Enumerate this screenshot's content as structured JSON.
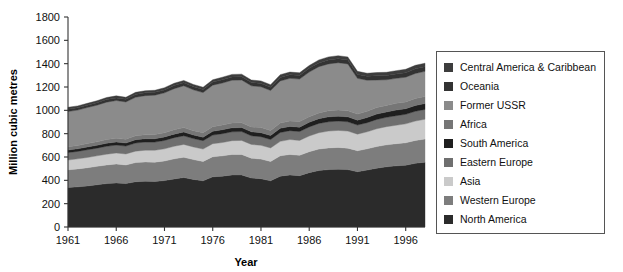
{
  "chart_data": {
    "type": "area",
    "title": "",
    "xlabel": "Year",
    "ylabel": "Million cubic metres",
    "xlim": [
      1961,
      1998
    ],
    "ylim": [
      0,
      1800
    ],
    "ytick_step": 200,
    "xtick_step": 5,
    "grid": false,
    "stacked": true,
    "legend_position": "right",
    "xticks": [
      1961,
      1966,
      1971,
      1976,
      1981,
      1986,
      1991,
      1996
    ],
    "yticks": [
      0,
      200,
      400,
      600,
      800,
      1000,
      1200,
      1400,
      1600,
      1800
    ],
    "x": [
      1961,
      1962,
      1963,
      1964,
      1965,
      1966,
      1967,
      1968,
      1969,
      1970,
      1971,
      1972,
      1973,
      1974,
      1975,
      1976,
      1977,
      1978,
      1979,
      1980,
      1981,
      1982,
      1983,
      1984,
      1985,
      1986,
      1987,
      1988,
      1989,
      1990,
      1991,
      1992,
      1993,
      1994,
      1995,
      1996,
      1997,
      1998
    ],
    "series": [
      {
        "name": "North America",
        "color": "#2b2b2b",
        "values": [
          338,
          344,
          352,
          362,
          372,
          378,
          372,
          388,
          392,
          390,
          398,
          412,
          424,
          408,
          396,
          430,
          436,
          446,
          446,
          420,
          414,
          396,
          436,
          446,
          440,
          466,
          484,
          492,
          496,
          492,
          474,
          488,
          504,
          516,
          524,
          530,
          546,
          556
        ]
      },
      {
        "name": "Western Europe",
        "color": "#7d7d7d",
        "values": [
          152,
          154,
          156,
          158,
          160,
          162,
          160,
          164,
          166,
          166,
          168,
          172,
          174,
          170,
          166,
          172,
          174,
          176,
          176,
          170,
          168,
          166,
          174,
          176,
          174,
          180,
          184,
          186,
          186,
          184,
          180,
          182,
          186,
          188,
          190,
          192,
          196,
          198
        ]
      },
      {
        "name": "Asia",
        "color": "#cacaca",
        "values": [
          84,
          86,
          88,
          90,
          92,
          94,
          94,
          98,
          100,
          102,
          104,
          108,
          110,
          108,
          106,
          112,
          114,
          118,
          120,
          118,
          118,
          116,
          124,
          128,
          128,
          134,
          140,
          144,
          146,
          146,
          142,
          146,
          152,
          156,
          158,
          162,
          166,
          170
        ]
      },
      {
        "name": "Eastern Europe",
        "color": "#6f6f6f",
        "values": [
          64,
          64,
          66,
          66,
          68,
          68,
          68,
          70,
          70,
          70,
          72,
          74,
          74,
          72,
          72,
          74,
          76,
          76,
          76,
          74,
          74,
          72,
          76,
          76,
          76,
          78,
          80,
          80,
          80,
          80,
          78,
          78,
          80,
          80,
          82,
          82,
          84,
          84
        ]
      },
      {
        "name": "South America",
        "color": "#1f1f1f",
        "values": [
          22,
          22,
          24,
          24,
          26,
          26,
          26,
          28,
          28,
          28,
          30,
          30,
          32,
          30,
          30,
          32,
          34,
          34,
          34,
          34,
          34,
          34,
          36,
          36,
          38,
          40,
          40,
          42,
          42,
          42,
          42,
          44,
          46,
          46,
          48,
          48,
          50,
          50
        ]
      },
      {
        "name": "Africa",
        "color": "#767676",
        "values": [
          28,
          28,
          30,
          30,
          32,
          32,
          32,
          34,
          34,
          36,
          36,
          38,
          38,
          38,
          38,
          40,
          40,
          42,
          42,
          42,
          44,
          44,
          46,
          46,
          48,
          48,
          50,
          52,
          52,
          52,
          52,
          54,
          56,
          56,
          58,
          58,
          60,
          60
        ]
      },
      {
        "name": "Former USSR",
        "color": "#8b8b8b",
        "values": [
          302,
          304,
          308,
          314,
          320,
          324,
          320,
          330,
          336,
          338,
          342,
          352,
          358,
          350,
          344,
          356,
          360,
          366,
          366,
          352,
          350,
          342,
          360,
          366,
          364,
          382,
          396,
          402,
          406,
          402,
          306,
          266,
          236,
          220,
          214,
          212,
          214,
          216
        ]
      },
      {
        "name": "Oceania",
        "color": "#333333",
        "values": [
          20,
          20,
          20,
          22,
          22,
          22,
          22,
          24,
          24,
          24,
          24,
          26,
          26,
          26,
          26,
          26,
          28,
          28,
          28,
          28,
          28,
          28,
          30,
          30,
          30,
          32,
          32,
          34,
          34,
          34,
          34,
          34,
          36,
          36,
          38,
          38,
          40,
          40
        ]
      },
      {
        "name": "Central America & Caribbean",
        "color": "#3d3d3d",
        "values": [
          16,
          16,
          16,
          16,
          18,
          18,
          18,
          18,
          18,
          18,
          20,
          20,
          20,
          20,
          20,
          20,
          22,
          22,
          22,
          22,
          22,
          22,
          24,
          24,
          24,
          24,
          26,
          26,
          26,
          26,
          26,
          26,
          28,
          28,
          28,
          30,
          30,
          30
        ]
      }
    ]
  },
  "legend": {
    "items": [
      {
        "label": "Central America & Caribbean",
        "color": "#3d3d3d"
      },
      {
        "label": "Oceania",
        "color": "#333333"
      },
      {
        "label": "Former USSR",
        "color": "#8b8b8b"
      },
      {
        "label": "Africa",
        "color": "#767676"
      },
      {
        "label": "South America",
        "color": "#1f1f1f"
      },
      {
        "label": "Eastern Europe",
        "color": "#6f6f6f"
      },
      {
        "label": "Asia",
        "color": "#cacaca"
      },
      {
        "label": "Western Europe",
        "color": "#7d7d7d"
      },
      {
        "label": "North America",
        "color": "#2b2b2b"
      }
    ]
  }
}
